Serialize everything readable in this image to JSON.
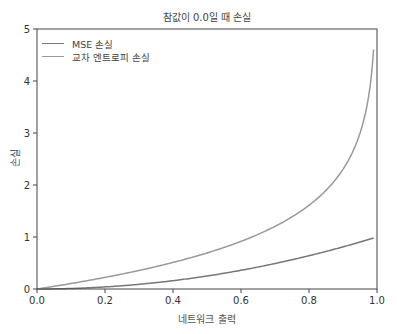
{
  "chart_data": {
    "type": "line",
    "title": "참값이 0.0일 때 손실",
    "xlabel": "네트워크 출력",
    "ylabel": "손실",
    "xlim": [
      0,
      1.0
    ],
    "ylim": [
      0,
      5
    ],
    "xticks": [
      "0.0",
      "0.2",
      "0.4",
      "0.6",
      "0.8",
      "1.0"
    ],
    "yticks": [
      "0",
      "1",
      "2",
      "3",
      "4",
      "5"
    ],
    "grid": false,
    "legend_position": "upper left",
    "x": [
      0.0,
      0.1,
      0.2,
      0.3,
      0.4,
      0.5,
      0.6,
      0.7,
      0.8,
      0.9,
      0.95,
      0.99
    ],
    "series": [
      {
        "name": "MSE 손실",
        "color": "#777777",
        "formula": "p^2",
        "values": [
          0.0,
          0.01,
          0.04,
          0.09,
          0.16,
          0.25,
          0.36,
          0.49,
          0.64,
          0.81,
          0.9025,
          0.9801
        ]
      },
      {
        "name": "교차 엔트로피 손실",
        "color": "#999999",
        "formula": "-ln(1-p)",
        "values": [
          0.0,
          0.105,
          0.223,
          0.357,
          0.511,
          0.693,
          0.916,
          1.204,
          1.609,
          2.303,
          2.996,
          4.605
        ]
      }
    ]
  }
}
